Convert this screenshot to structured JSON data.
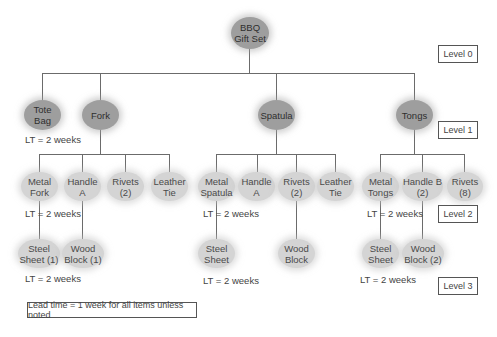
{
  "root": {
    "label": "BBQ\nGift Set"
  },
  "level1": [
    {
      "label": "Tote\nBag",
      "lt": "LT = 2 weeks"
    },
    {
      "label": "Fork"
    },
    {
      "label": "Spatula"
    },
    {
      "label": "Tongs"
    }
  ],
  "fork_children": [
    {
      "label": "Metal\nFork",
      "lt": "LT = 2 weeks"
    },
    {
      "label": "Handle A"
    },
    {
      "label": "Rivets\n(2)"
    },
    {
      "label": "Leather\nTie"
    }
  ],
  "fork_grandchildren": [
    {
      "label": "Steel\nSheet (1)",
      "lt": "LT = 2 weeks"
    },
    {
      "label": "Wood\nBlock (1)"
    }
  ],
  "spatula_children": [
    {
      "label": "Metal\nSpatula",
      "lt": "LT = 2 weeks"
    },
    {
      "label": "Handle A"
    },
    {
      "label": "Rivets\n(2)"
    },
    {
      "label": "Leather\nTie"
    }
  ],
  "spatula_grandchildren": [
    {
      "label": "Steel\nSheet",
      "lt": "LT = 2 weeks"
    },
    {
      "label": "Wood\nBlock"
    }
  ],
  "tongs_children": [
    {
      "label": "Metal\nTongs",
      "lt": "LT = 2 weeks"
    },
    {
      "label": "Handle B\n(2)"
    },
    {
      "label": "Rivets\n(8)"
    }
  ],
  "tongs_grandchildren": [
    {
      "label": "Steel\nSheet",
      "lt": "LT = 2 weeks"
    },
    {
      "label": "Wood\nBlock (2)"
    }
  ],
  "levels": [
    "Level 0",
    "Level 1",
    "Level 2",
    "Level 3"
  ],
  "note": "Lead time = 1 week for all items unless noted",
  "colors": {
    "level1_node": "#9e9e9e",
    "level2_node": "#d4d4d4",
    "line": "#6b6b6b"
  }
}
